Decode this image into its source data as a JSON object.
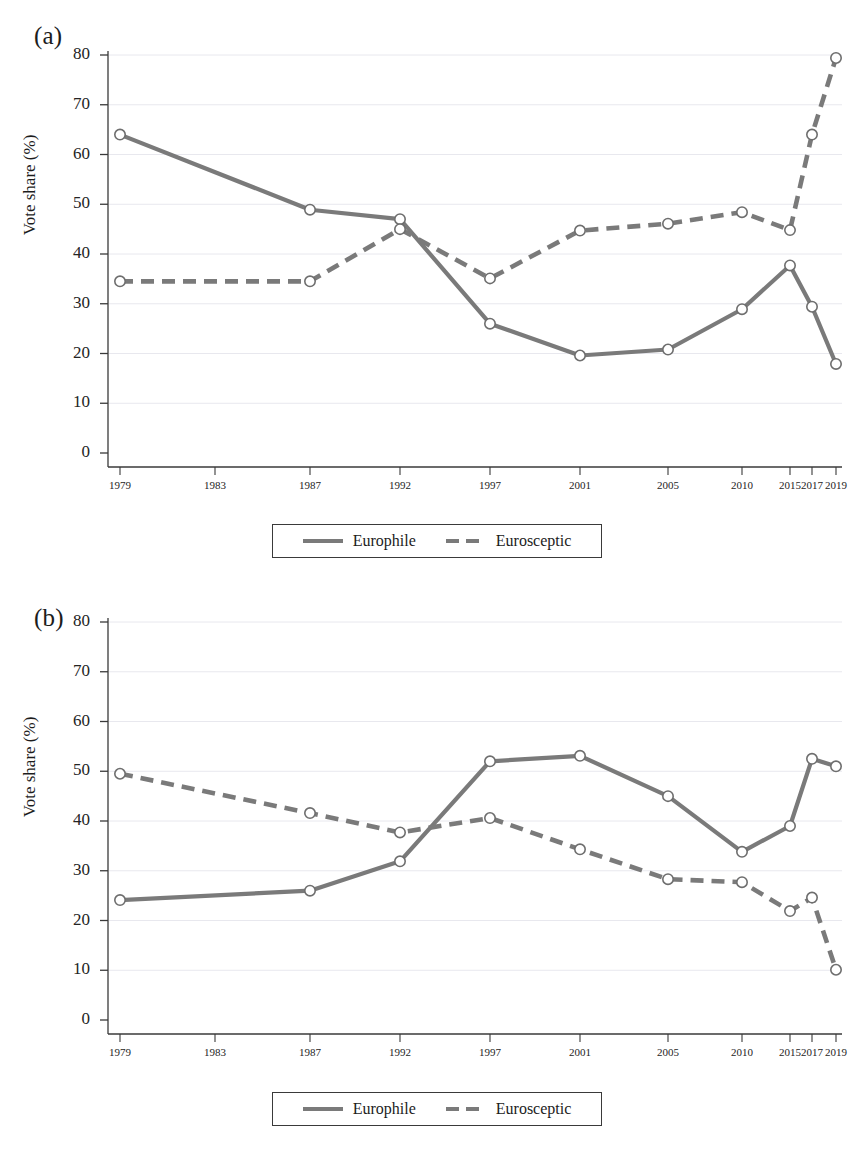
{
  "figure": {
    "panels": [
      {
        "id": "a",
        "label": "(a)"
      },
      {
        "id": "b",
        "label": "(b)"
      }
    ],
    "legend": {
      "europhile_label": "Europhile",
      "eurosceptic_label": "Eurosceptic"
    },
    "colors": {
      "line": "#7a7a7a",
      "marker_fill": "#ffffff",
      "marker_stroke": "#6e6e6e",
      "axis": "#3a3a3a",
      "grid": "#e8e8ee",
      "text": "#1c1c1c"
    }
  },
  "chart_data": [
    {
      "type": "line",
      "panel": "a",
      "title": "(a)",
      "xlabel": "",
      "ylabel": "Vote share (%)",
      "categories": [
        "1979",
        "1983",
        "1987",
        "1992",
        "1997",
        "2001",
        "2005",
        "2010",
        "2015",
        "2017",
        "2019"
      ],
      "ylim": [
        0,
        80
      ],
      "yticks": [
        0,
        10,
        20,
        30,
        40,
        50,
        60,
        70,
        80
      ],
      "grid": true,
      "legend_position": "bottom",
      "series": [
        {
          "name": "Europhile",
          "style": "solid",
          "values": [
            64.0,
            null,
            48.9,
            47.0,
            26.0,
            19.6,
            20.8,
            28.9,
            37.7,
            29.4,
            17.9
          ]
        },
        {
          "name": "Eurosceptic",
          "style": "dashed",
          "values": [
            34.5,
            null,
            34.5,
            45.0,
            35.1,
            44.7,
            46.1,
            48.4,
            44.8,
            64.0,
            79.4
          ]
        }
      ]
    },
    {
      "type": "line",
      "panel": "b",
      "title": "(b)",
      "xlabel": "",
      "ylabel": "Vote share (%)",
      "categories": [
        "1979",
        "1983",
        "1987",
        "1992",
        "1997",
        "2001",
        "2005",
        "2010",
        "2015",
        "2017",
        "2019"
      ],
      "ylim": [
        0,
        80
      ],
      "yticks": [
        0,
        10,
        20,
        30,
        40,
        50,
        60,
        70,
        80
      ],
      "grid": true,
      "legend_position": "bottom",
      "series": [
        {
          "name": "Europhile",
          "style": "solid",
          "values": [
            24.1,
            null,
            26.0,
            31.9,
            52.0,
            53.1,
            45.0,
            33.8,
            39.0,
            52.5,
            51.0
          ]
        },
        {
          "name": "Eurosceptic",
          "style": "dashed",
          "values": [
            49.5,
            null,
            41.6,
            37.7,
            40.6,
            34.3,
            28.3,
            27.7,
            21.9,
            24.6,
            10.1
          ]
        }
      ]
    }
  ]
}
